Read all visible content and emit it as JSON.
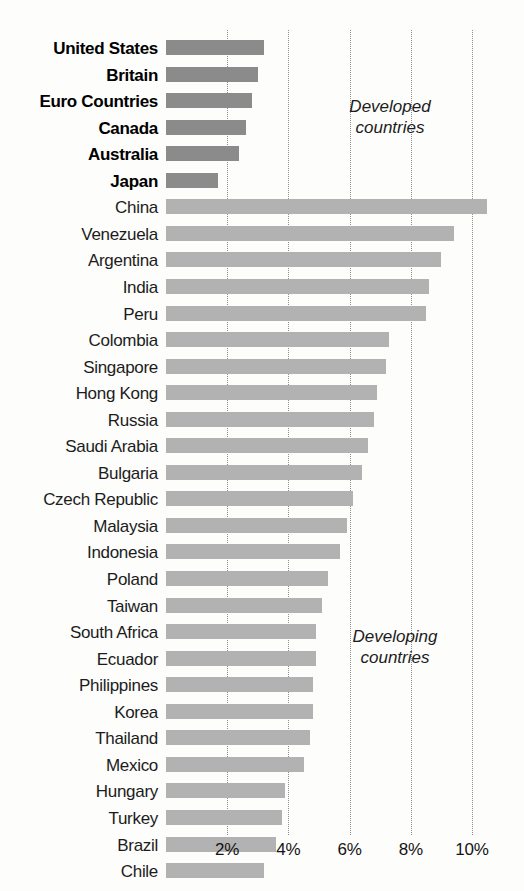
{
  "chart_data": {
    "type": "bar",
    "orientation": "horizontal",
    "title": "",
    "subtitle": "",
    "xlabel": "",
    "ylabel": "",
    "xlim": [
      0,
      11.2
    ],
    "grid": true,
    "gridlines": [
      2,
      4,
      6,
      8,
      10
    ],
    "tick_labels": [
      "2%",
      "4%",
      "6%",
      "8%",
      "10%"
    ],
    "value_suffix": "%",
    "legend_position": "none",
    "annotations": [
      {
        "text": "Developed\ncountries",
        "group": "developed"
      },
      {
        "text": "Developing\ncountries",
        "group": "developing"
      }
    ],
    "groups": [
      {
        "name": "developed",
        "color": "#8b8b8b"
      },
      {
        "name": "developing",
        "color": "#b2b2b2"
      }
    ],
    "categories": [
      "United States",
      "Britain",
      "Euro Countries",
      "Canada",
      "Australia",
      "Japan",
      "China",
      "Venezuela",
      "Argentina",
      "India",
      "Peru",
      "Colombia",
      "Singapore",
      "Hong Kong",
      "Russia",
      "Saudi Arabia",
      "Bulgaria",
      "Czech Republic",
      "Malaysia",
      "Indonesia",
      "Poland",
      "Taiwan",
      "South Africa",
      "Ecuador",
      "Philippines",
      "Korea",
      "Thailand",
      "Mexico",
      "Hungary",
      "Turkey",
      "Brazil",
      "Chile"
    ],
    "values": [
      3.2,
      3.0,
      2.8,
      2.6,
      2.4,
      1.7,
      10.5,
      9.4,
      9.0,
      8.6,
      8.5,
      7.3,
      7.2,
      6.9,
      6.8,
      6.6,
      6.4,
      6.1,
      5.9,
      5.7,
      5.3,
      5.1,
      4.9,
      4.9,
      4.8,
      4.8,
      4.7,
      4.5,
      3.9,
      3.8,
      3.6,
      3.2
    ],
    "bars": [
      {
        "label": "United States",
        "value": 3.2,
        "group": "developed"
      },
      {
        "label": "Britain",
        "value": 3.0,
        "group": "developed"
      },
      {
        "label": "Euro Countries",
        "value": 2.8,
        "group": "developed"
      },
      {
        "label": "Canada",
        "value": 2.6,
        "group": "developed"
      },
      {
        "label": "Australia",
        "value": 2.4,
        "group": "developed"
      },
      {
        "label": "Japan",
        "value": 1.7,
        "group": "developed"
      },
      {
        "label": "China",
        "value": 10.5,
        "group": "developing"
      },
      {
        "label": "Venezuela",
        "value": 9.4,
        "group": "developing"
      },
      {
        "label": "Argentina",
        "value": 9.0,
        "group": "developing"
      },
      {
        "label": "India",
        "value": 8.6,
        "group": "developing"
      },
      {
        "label": "Peru",
        "value": 8.5,
        "group": "developing"
      },
      {
        "label": "Colombia",
        "value": 7.3,
        "group": "developing"
      },
      {
        "label": "Singapore",
        "value": 7.2,
        "group": "developing"
      },
      {
        "label": "Hong Kong",
        "value": 6.9,
        "group": "developing"
      },
      {
        "label": "Russia",
        "value": 6.8,
        "group": "developing"
      },
      {
        "label": "Saudi Arabia",
        "value": 6.6,
        "group": "developing"
      },
      {
        "label": "Bulgaria",
        "value": 6.4,
        "group": "developing"
      },
      {
        "label": "Czech Republic",
        "value": 6.1,
        "group": "developing"
      },
      {
        "label": "Malaysia",
        "value": 5.9,
        "group": "developing"
      },
      {
        "label": "Indonesia",
        "value": 5.7,
        "group": "developing"
      },
      {
        "label": "Poland",
        "value": 5.3,
        "group": "developing"
      },
      {
        "label": "Taiwan",
        "value": 5.1,
        "group": "developing"
      },
      {
        "label": "South Africa",
        "value": 4.9,
        "group": "developing"
      },
      {
        "label": "Ecuador",
        "value": 4.9,
        "group": "developing"
      },
      {
        "label": "Philippines",
        "value": 4.8,
        "group": "developing"
      },
      {
        "label": "Korea",
        "value": 4.8,
        "group": "developing"
      },
      {
        "label": "Thailand",
        "value": 4.7,
        "group": "developing"
      },
      {
        "label": "Mexico",
        "value": 4.5,
        "group": "developing"
      },
      {
        "label": "Hungary",
        "value": 3.9,
        "group": "developing"
      },
      {
        "label": "Turkey",
        "value": 3.8,
        "group": "developing"
      },
      {
        "label": "Brazil",
        "value": 3.6,
        "group": "developing"
      },
      {
        "label": "Chile",
        "value": 3.2,
        "group": "developing"
      }
    ]
  },
  "annotations": {
    "developed": "Developed\ncountries",
    "developing": "Developing\ncountries"
  }
}
